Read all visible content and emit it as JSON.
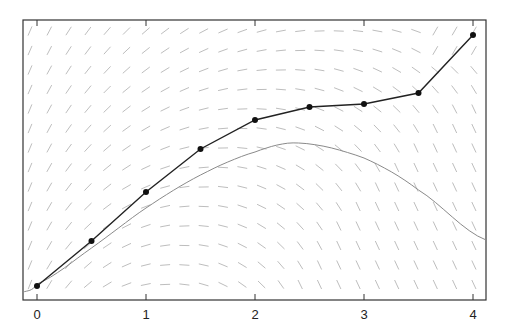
{
  "chart_data": {
    "type": "line",
    "title": "",
    "xlabel": "",
    "ylabel": "",
    "xlim": [
      -0.13,
      4.12
    ],
    "x_ticks": [
      "0",
      "1",
      "2",
      "3",
      "4"
    ],
    "grid": false,
    "legend": null,
    "background": "slope field (direction field) of short gray line segments",
    "series": [
      {
        "name": "numerical solution (Euler steps)",
        "style": "dark line with dot markers",
        "color": "#222222",
        "x": [
          0,
          0.5,
          1,
          1.5,
          2,
          2.5,
          3,
          3.5,
          4
        ],
        "y_pixels": [
          286,
          241,
          192,
          149,
          120,
          107,
          104,
          93,
          35
        ]
      },
      {
        "name": "exact solution",
        "style": "thin gray curve",
        "color": "#888888",
        "x": [
          -0.13,
          0,
          0.5,
          1,
          1.5,
          2,
          2.4,
          3,
          3.5,
          4.12
        ],
        "y_pixels": [
          292,
          284,
          248,
          208,
          175,
          152,
          143,
          158,
          190,
          240
        ]
      }
    ]
  },
  "axis": {
    "tick_labels": [
      "0",
      "1",
      "2",
      "3",
      "4"
    ]
  }
}
